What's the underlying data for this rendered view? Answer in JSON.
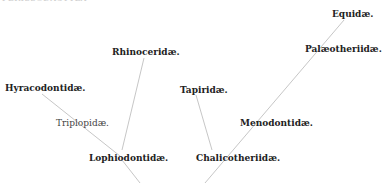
{
  "diagram": {
    "header_text": "PERISSODACTYLA",
    "type": "phylogenetic-tree",
    "nodes": [
      {
        "id": "equidae",
        "label": "Equidæ."
      },
      {
        "id": "palaeotheriidae",
        "label": "Palæotheriidæ."
      },
      {
        "id": "rhinoceridae",
        "label": "Rhinoceridæ."
      },
      {
        "id": "hyracodontidae",
        "label": "Hyracodontidæ."
      },
      {
        "id": "tapiridae",
        "label": "Tapiridæ."
      },
      {
        "id": "triplopidae",
        "label": "Triplopidæ."
      },
      {
        "id": "menodontidae",
        "label": "Menodontidæ."
      },
      {
        "id": "lophiodontidae",
        "label": "Lophiodontidæ."
      },
      {
        "id": "chalicotheriidae",
        "label": "Chalicotheriidæ."
      }
    ],
    "line_color": "#bbbbbb"
  }
}
